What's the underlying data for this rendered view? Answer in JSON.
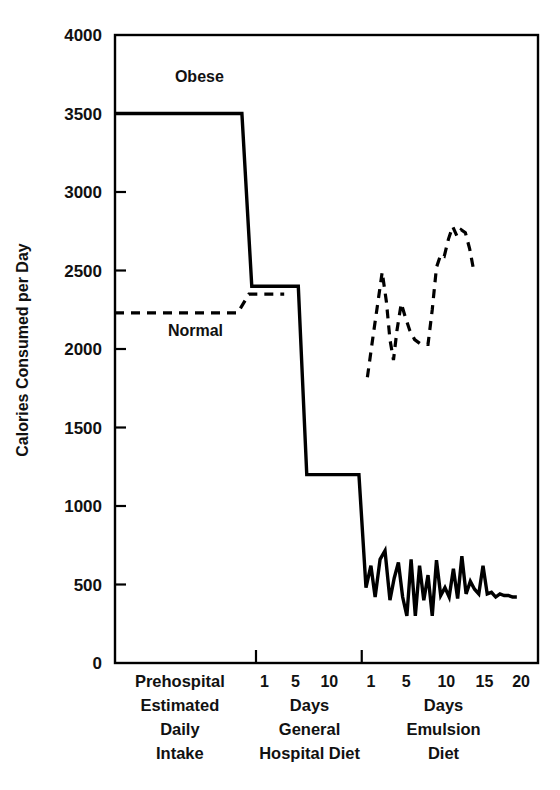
{
  "figure": {
    "background": "#ffffff",
    "ink": "#000000"
  },
  "chart_data": {
    "type": "line",
    "title": "",
    "xlabel": "",
    "ylabel": "Calories Consumed per Day",
    "ylim": [
      0,
      4000
    ],
    "ytick_values": [
      0,
      500,
      1000,
      1500,
      2000,
      2500,
      3000,
      3500,
      4000
    ],
    "ytick_labels": [
      "0",
      "500",
      "1000",
      "1500",
      "2000",
      "2500",
      "3000",
      "3500",
      "4000"
    ],
    "grid": false,
    "legend_position": "inline-annotation",
    "frame": "box",
    "x_sections": [
      {
        "id": "prehospital",
        "caption_lines": [
          "Prehospital",
          "Estimated",
          "Daily",
          "Intake"
        ],
        "ticks": [],
        "tick_labels": []
      },
      {
        "id": "general-hospital-diet",
        "caption_lines": [
          "Days",
          "General",
          "Hospital Diet"
        ],
        "ticks": [
          1,
          5,
          10
        ],
        "tick_labels": [
          "1",
          "5",
          "10"
        ]
      },
      {
        "id": "emulsion-diet",
        "caption_lines": [
          "Days",
          "Emulsion",
          "Diet"
        ],
        "ticks": [
          1,
          5,
          10,
          15,
          20
        ],
        "tick_labels": [
          "1",
          "5",
          "10",
          "15",
          "20"
        ]
      }
    ],
    "section_caption_rows": [
      [
        "Prehospital",
        "Days",
        "Days"
      ],
      [
        "Estimated",
        "Days",
        "Days"
      ],
      [
        "Daily",
        "General",
        "Emulsion"
      ],
      [
        "Intake",
        "Hospital Diet",
        "Diet"
      ]
    ],
    "series": [
      {
        "name": "Obese",
        "style": "solid",
        "label": "Obese",
        "points": [
          [
            0.0,
            3500
          ],
          [
            18.0,
            3500
          ],
          [
            19.4,
            2400
          ],
          [
            26.0,
            2400
          ],
          [
            27.2,
            1200
          ],
          [
            34.6,
            1200
          ],
          [
            35.6,
            480
          ],
          [
            36.3,
            620
          ],
          [
            36.9,
            420
          ],
          [
            37.6,
            660
          ],
          [
            38.3,
            715
          ],
          [
            39.0,
            400
          ],
          [
            39.6,
            540
          ],
          [
            40.2,
            640
          ],
          [
            40.8,
            420
          ],
          [
            41.4,
            300
          ],
          [
            42.0,
            660
          ],
          [
            42.6,
            300
          ],
          [
            43.2,
            620
          ],
          [
            43.8,
            400
          ],
          [
            44.4,
            560
          ],
          [
            45.0,
            300
          ],
          [
            45.6,
            655
          ],
          [
            46.2,
            430
          ],
          [
            46.8,
            480
          ],
          [
            47.4,
            420
          ],
          [
            48.0,
            600
          ],
          [
            48.6,
            410
          ],
          [
            49.2,
            680
          ],
          [
            49.8,
            440
          ],
          [
            50.4,
            520
          ],
          [
            51.0,
            470
          ],
          [
            51.6,
            440
          ],
          [
            52.2,
            620
          ],
          [
            52.8,
            440
          ],
          [
            53.4,
            450
          ],
          [
            54.0,
            420
          ],
          [
            54.6,
            440
          ],
          [
            55.2,
            430
          ],
          [
            55.8,
            430
          ],
          [
            56.4,
            420
          ],
          [
            57.0,
            420
          ]
        ]
      },
      {
        "name": "Normal",
        "style": "dashed",
        "label": "Normal",
        "segments": [
          [
            [
              0.0,
              2230
            ],
            [
              17.4,
              2230
            ],
            [
              19.0,
              2350
            ],
            [
              24.0,
              2350
            ]
          ],
          [
            [
              35.8,
              1820
            ],
            [
              36.6,
              2080
            ],
            [
              37.3,
              2300
            ],
            [
              37.9,
              2490
            ],
            [
              38.5,
              2300
            ],
            [
              39.0,
              2060
            ],
            [
              39.5,
              1930
            ],
            [
              40.0,
              2120
            ],
            [
              40.6,
              2290
            ],
            [
              41.2,
              2200
            ],
            [
              41.8,
              2120
            ],
            [
              42.5,
              2060
            ],
            [
              43.4,
              2030
            ],
            [
              44.4,
              2030
            ],
            [
              45.0,
              2250
            ],
            [
              45.6,
              2520
            ],
            [
              46.2,
              2600
            ],
            [
              46.7,
              2590
            ],
            [
              47.3,
              2700
            ],
            [
              47.9,
              2780
            ],
            [
              48.5,
              2720
            ],
            [
              49.1,
              2760
            ],
            [
              49.7,
              2740
            ],
            [
              50.3,
              2640
            ],
            [
              50.8,
              2520
            ]
          ]
        ]
      }
    ],
    "annotations": [
      {
        "text": "Obese",
        "x": 8.5,
        "y": 3700,
        "series": "Obese"
      },
      {
        "text": "Normal",
        "x": 7.5,
        "y": 2080,
        "series": "Normal"
      }
    ]
  }
}
